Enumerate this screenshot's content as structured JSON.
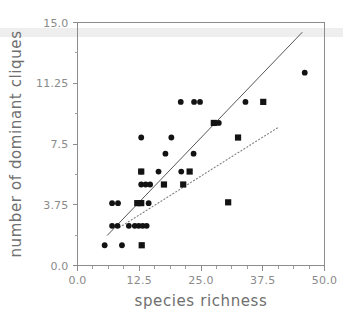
{
  "chart_data": {
    "type": "scatter",
    "title": "",
    "xlabel": "species richness",
    "ylabel": "number of dominant cliques",
    "xlim": [
      0.0,
      50.0
    ],
    "ylim": [
      0.0,
      15.0
    ],
    "grid": false,
    "legend": "none",
    "xticks": [
      {
        "value": 0.0,
        "label": "0.0"
      },
      {
        "value": 12.5,
        "label": "12.5"
      },
      {
        "value": 25.0,
        "label": "25.0"
      },
      {
        "value": 37.5,
        "label": "37.5"
      },
      {
        "value": 50.0,
        "label": "50.0"
      }
    ],
    "yticks": [
      {
        "value": 0.0,
        "label": "0.0"
      },
      {
        "value": 3.75,
        "label": "3.75"
      },
      {
        "value": 7.5,
        "label": "7.5"
      },
      {
        "value": 11.25,
        "label": "11.25"
      },
      {
        "value": 15.0,
        "label": "15.0"
      }
    ],
    "xminor_step": 3.125,
    "yminor_step": 1.875,
    "series": [
      {
        "name": "circle-markers",
        "marker": "circle",
        "color": "#131313",
        "points": [
          [
            5.5,
            1.25
          ],
          [
            9.0,
            1.25
          ],
          [
            7.0,
            2.45
          ],
          [
            8.1,
            2.45
          ],
          [
            10.4,
            2.45
          ],
          [
            11.6,
            2.45
          ],
          [
            12.4,
            2.45
          ],
          [
            13.2,
            2.45
          ],
          [
            14.0,
            2.45
          ],
          [
            7.0,
            3.85
          ],
          [
            8.2,
            3.85
          ],
          [
            12.6,
            3.85
          ],
          [
            14.4,
            3.85
          ],
          [
            12.9,
            5.0
          ],
          [
            13.8,
            5.0
          ],
          [
            14.7,
            5.0
          ],
          [
            12.9,
            5.8
          ],
          [
            16.4,
            5.8
          ],
          [
            21.0,
            5.8
          ],
          [
            17.8,
            6.9
          ],
          [
            23.5,
            6.9
          ],
          [
            12.9,
            7.9
          ],
          [
            19.0,
            7.9
          ],
          [
            20.9,
            10.1
          ],
          [
            23.6,
            10.1
          ],
          [
            24.8,
            10.1
          ],
          [
            34.0,
            10.1
          ],
          [
            27.6,
            8.8
          ],
          [
            28.6,
            8.8
          ],
          [
            46.0,
            11.9
          ]
        ]
      },
      {
        "name": "square-markers",
        "marker": "square",
        "color": "#131313",
        "points": [
          [
            13.0,
            1.25
          ],
          [
            12.1,
            3.85
          ],
          [
            12.9,
            3.85
          ],
          [
            17.5,
            5.0
          ],
          [
            21.4,
            5.0
          ],
          [
            12.9,
            5.8
          ],
          [
            22.7,
            5.8
          ],
          [
            30.5,
            3.9
          ],
          [
            32.5,
            7.9
          ],
          [
            37.6,
            10.1
          ],
          [
            27.6,
            8.8
          ]
        ]
      }
    ],
    "fit_lines": [
      {
        "name": "solid-regression",
        "style": "solid",
        "x0": 6.0,
        "y0": 1.85,
        "x1": 45.5,
        "y1": 14.4
      },
      {
        "name": "dotted-regression",
        "style": "dotted",
        "x0": 8.5,
        "y0": 2.35,
        "x1": 40.5,
        "y1": 8.5
      }
    ]
  }
}
